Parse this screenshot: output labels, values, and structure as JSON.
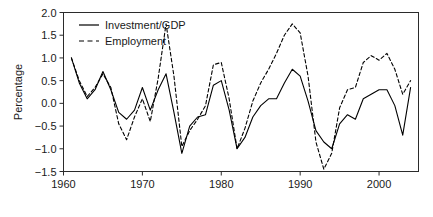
{
  "chart_data": {
    "type": "line",
    "title": "",
    "xlabel": "",
    "ylabel": "Percentage",
    "xlim": [
      1960,
      2005
    ],
    "ylim": [
      -1.5,
      2.0
    ],
    "grid": false,
    "legend_position": "top-left",
    "xticks": [
      1960,
      1970,
      1980,
      1990,
      2000
    ],
    "xtick_labels": [
      "1960",
      "1970",
      "1980",
      "1990",
      "2000"
    ],
    "yticks": [
      -1.5,
      -1.0,
      -0.5,
      0.0,
      0.5,
      1.0,
      1.5,
      2.0
    ],
    "ytick_labels": [
      "-1.5",
      "-1.0",
      "-0.5",
      "0.0",
      "0.5",
      "1.0",
      "1.5",
      "2.0"
    ],
    "x": [
      1961,
      1962,
      1963,
      1964,
      1965,
      1966,
      1967,
      1968,
      1969,
      1970,
      1971,
      1972,
      1973,
      1974,
      1975,
      1976,
      1977,
      1978,
      1979,
      1980,
      1981,
      1982,
      1983,
      1984,
      1985,
      1986,
      1987,
      1988,
      1989,
      1990,
      1991,
      1992,
      1993,
      1994,
      1995,
      1996,
      1997,
      1998,
      1999,
      2000,
      2001,
      2002,
      2003,
      2004
    ],
    "series": [
      {
        "name": "Investment/GDP",
        "style": "solid",
        "color": "#000000",
        "values": [
          1.0,
          0.45,
          0.1,
          0.3,
          0.7,
          0.3,
          -0.2,
          -0.35,
          -0.15,
          0.35,
          -0.15,
          0.3,
          0.65,
          -0.2,
          -1.1,
          -0.5,
          -0.3,
          -0.25,
          0.4,
          0.5,
          -0.15,
          -1.0,
          -0.75,
          -0.3,
          -0.05,
          0.1,
          0.1,
          0.45,
          0.75,
          0.6,
          0.05,
          -0.6,
          -0.85,
          -1.0,
          -0.45,
          -0.25,
          -0.35,
          0.1,
          0.2,
          0.3,
          0.3,
          -0.05,
          -0.7,
          0.35
        ]
      },
      {
        "name": "Employment",
        "style": "dashed",
        "color": "#000000",
        "values": [
          1.0,
          0.5,
          0.15,
          0.35,
          0.65,
          0.35,
          -0.45,
          -0.8,
          -0.3,
          0.1,
          -0.4,
          0.55,
          1.75,
          0.6,
          -0.95,
          -0.6,
          -0.35,
          -0.05,
          0.85,
          0.9,
          0.1,
          -1.0,
          -0.55,
          0.05,
          0.45,
          0.75,
          1.1,
          1.5,
          1.75,
          1.55,
          0.6,
          -0.85,
          -1.45,
          -1.1,
          -0.1,
          0.3,
          0.35,
          0.9,
          1.05,
          0.95,
          1.1,
          0.75,
          0.2,
          0.5
        ]
      }
    ]
  },
  "legend": {
    "entries": [
      {
        "label": "Investment/GDP",
        "style": "solid"
      },
      {
        "label": "Employment",
        "style": "dashed"
      }
    ]
  }
}
